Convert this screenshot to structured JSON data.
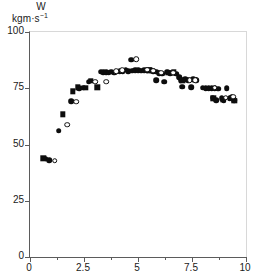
{
  "chart_data": {
    "type": "scatter",
    "title": "",
    "subtitle": "",
    "ylabel_line1": "W",
    "ylabel_line2": "kgm·s",
    "ylabel_line2_exp": "−1",
    "xlabel": "",
    "xlim": [
      0,
      10
    ],
    "ylim": [
      0,
      100
    ],
    "xticks": [
      0,
      2.5,
      5,
      7.5,
      10
    ],
    "xticklabels": [
      "0",
      "2.5",
      "5",
      "7.5",
      "10"
    ],
    "xminorticks": [
      1.25,
      3.75,
      6.25,
      8.75
    ],
    "yticks": [
      0,
      25,
      50,
      75,
      100
    ],
    "yticklabels": [
      "0",
      "25",
      "50",
      "75",
      "100"
    ],
    "grid": false,
    "legend": "none",
    "series": [
      {
        "name": "filled-circle",
        "marker": "filled-circle",
        "color": "#0d0d0d",
        "points": [
          [
            0.72,
            43.6
          ],
          [
            0.88,
            43.0
          ],
          [
            1.32,
            56.2
          ],
          [
            1.92,
            69.2
          ],
          [
            2.28,
            74.9
          ],
          [
            2.45,
            75.2
          ],
          [
            2.72,
            78.0
          ],
          [
            3.28,
            82.4
          ],
          [
            3.4,
            82.1
          ],
          [
            3.52,
            82.2
          ],
          [
            3.64,
            82.0
          ],
          [
            3.76,
            82.3
          ],
          [
            3.9,
            81.9
          ],
          [
            4.02,
            82.3
          ],
          [
            4.16,
            82.6
          ],
          [
            4.3,
            82.5
          ],
          [
            4.44,
            83.2
          ],
          [
            4.56,
            82.6
          ],
          [
            4.68,
            87.6
          ],
          [
            4.72,
            82.8
          ],
          [
            4.86,
            82.9
          ],
          [
            5.0,
            83.0
          ],
          [
            5.14,
            82.8
          ],
          [
            5.28,
            83.0
          ],
          [
            5.42,
            83.1
          ],
          [
            5.56,
            82.9
          ],
          [
            5.7,
            82.6
          ],
          [
            5.84,
            82.3
          ],
          [
            5.84,
            78.6
          ],
          [
            5.98,
            81.8
          ],
          [
            6.12,
            81.5
          ],
          [
            6.2,
            77.9
          ],
          [
            6.34,
            82.4
          ],
          [
            6.48,
            81.7
          ],
          [
            6.62,
            82.0
          ],
          [
            6.76,
            81.5
          ],
          [
            6.9,
            80.0
          ],
          [
            6.98,
            78.6
          ],
          [
            7.04,
            75.7
          ],
          [
            7.18,
            79.0
          ],
          [
            7.32,
            78.6
          ],
          [
            7.46,
            75.5
          ],
          [
            7.56,
            78.9
          ],
          [
            7.7,
            78.6
          ],
          [
            8.0,
            75.2
          ],
          [
            8.14,
            75.1
          ],
          [
            8.28,
            75.0
          ],
          [
            8.42,
            75.1
          ],
          [
            8.46,
            70.8
          ],
          [
            8.56,
            74.9
          ],
          [
            8.62,
            69.8
          ],
          [
            8.72,
            74.8
          ],
          [
            8.88,
            70.6
          ],
          [
            8.96,
            69.6
          ],
          [
            9.1,
            74.9
          ],
          [
            9.24,
            70.5
          ],
          [
            9.34,
            71.0
          ],
          [
            9.46,
            69.8
          ]
        ]
      },
      {
        "name": "filled-square",
        "marker": "filled-square",
        "color": "#0d0d0d",
        "points": [
          [
            0.62,
            43.8
          ],
          [
            1.52,
            63.4
          ],
          [
            1.98,
            73.6
          ],
          [
            2.22,
            75.4
          ],
          [
            2.58,
            75.2
          ],
          [
            2.82,
            78.2
          ],
          [
            3.12,
            75.5
          ],
          [
            5.52,
            82.9
          ],
          [
            6.4,
            82.0
          ],
          [
            6.66,
            82.1
          ],
          [
            7.06,
            78.6
          ],
          [
            7.62,
            78.8
          ],
          [
            8.48,
            70.6
          ],
          [
            8.92,
            69.8
          ],
          [
            9.46,
            69.4
          ]
        ]
      },
      {
        "name": "open-circle",
        "marker": "open-circle",
        "color": "#0d0d0d",
        "points": [
          [
            1.14,
            42.8
          ],
          [
            1.72,
            58.8
          ],
          [
            2.14,
            69.0
          ],
          [
            3.02,
            78.0
          ],
          [
            3.52,
            77.9
          ],
          [
            4.0,
            82.6
          ],
          [
            4.26,
            83.0
          ],
          [
            4.92,
            87.8
          ],
          [
            5.42,
            83.2
          ],
          [
            5.7,
            82.8
          ],
          [
            6.08,
            82.0
          ],
          [
            6.62,
            81.9
          ],
          [
            7.4,
            78.7
          ],
          [
            7.66,
            78.7
          ],
          [
            8.56,
            75.2
          ],
          [
            9.06,
            70.8
          ],
          [
            9.4,
            71.2
          ]
        ]
      }
    ]
  }
}
